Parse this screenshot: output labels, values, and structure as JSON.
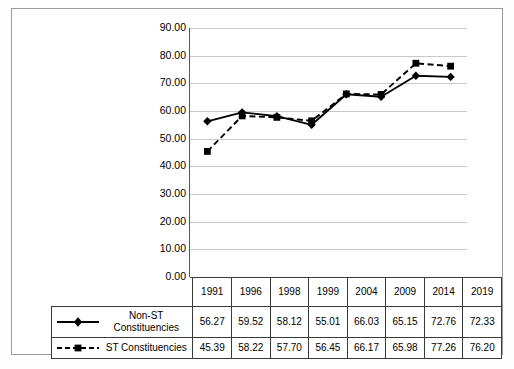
{
  "chart_data": {
    "type": "line",
    "title": "",
    "subtitle": "",
    "xlabel": "",
    "ylabel": "",
    "categories": [
      "1991",
      "1996",
      "1998",
      "1999",
      "2004",
      "2009",
      "2014",
      "2019"
    ],
    "ylim": [
      0,
      90
    ],
    "ytick_step": 10,
    "ytick_labels": [
      "90.00",
      "80.00",
      "70.00",
      "60.00",
      "50.00",
      "40.00",
      "30.00",
      "20.00",
      "10.00",
      "0.00"
    ],
    "ytick_values": [
      90,
      80,
      70,
      60,
      50,
      40,
      30,
      20,
      10,
      0
    ],
    "grid": true,
    "legend_position": "table-left",
    "series": [
      {
        "name": "Non-ST Constituencies",
        "name_line1": "Non-ST",
        "name_line2": "Constituencies",
        "marker": "diamond",
        "line_style": "solid",
        "color": "#000000",
        "values": [
          56.27,
          59.52,
          58.12,
          55.01,
          66.03,
          65.15,
          72.76,
          72.33
        ],
        "value_labels": [
          "56.27",
          "59.52",
          "58.12",
          "55.01",
          "66.03",
          "65.15",
          "72.76",
          "72.33"
        ]
      },
      {
        "name": "ST Constituencies",
        "name_line1": "ST Constituencies",
        "name_line2": "",
        "marker": "square",
        "line_style": "dashed",
        "color": "#000000",
        "values": [
          45.39,
          58.22,
          57.7,
          56.45,
          66.17,
          65.98,
          77.26,
          76.2
        ],
        "value_labels": [
          "45.39",
          "58.22",
          "57.70",
          "56.45",
          "66.17",
          "65.98",
          "77.26",
          "76.20"
        ]
      }
    ]
  },
  "colors": {
    "frame": "#9a9a9a",
    "gridline": "#c9c9c9",
    "axis": "#555555",
    "series": "#000000",
    "table_border": "#3a3a3a",
    "background": "#ffffff"
  }
}
